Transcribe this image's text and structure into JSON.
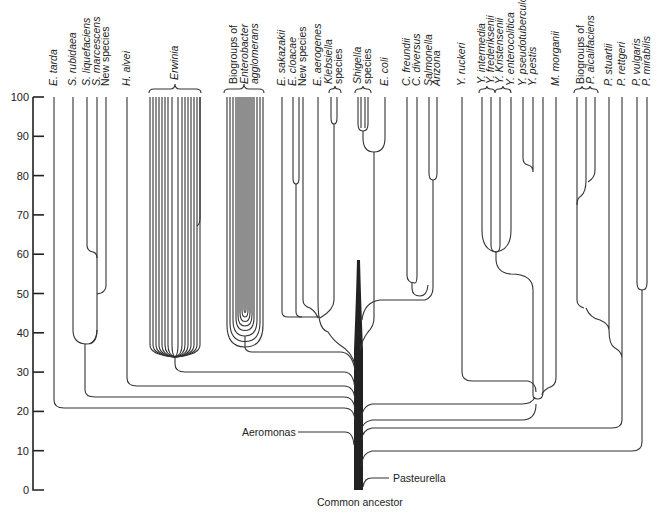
{
  "diagram": {
    "type": "phylogenetic-tree",
    "y_axis": {
      "ticks": [
        0,
        10,
        20,
        30,
        40,
        50,
        60,
        70,
        80,
        90,
        100
      ],
      "range": [
        0,
        100
      ]
    },
    "root_label": "Common ancestor",
    "side_labels": {
      "aeromonas": "Aeromonas",
      "pasteurella": "Pasteurella"
    },
    "leaves": [
      {
        "id": "e_tarda",
        "lines": [
          "E. tarda"
        ],
        "italic": [
          true
        ]
      },
      {
        "id": "s_rubidaea",
        "lines": [
          "S. rubidaea"
        ],
        "italic": [
          true
        ]
      },
      {
        "id": "s_liquefaciens",
        "lines": [
          "S. liquefaciens"
        ],
        "italic": [
          true
        ]
      },
      {
        "id": "s_marcescens",
        "lines": [
          "S. marcescens"
        ],
        "italic": [
          true
        ]
      },
      {
        "id": "new_species_1",
        "lines": [
          "New species"
        ],
        "italic": [
          false
        ]
      },
      {
        "id": "h_alvei",
        "lines": [
          "H. alvei"
        ],
        "italic": [
          true
        ]
      },
      {
        "id": "erwinia",
        "lines": [
          "Erwinia"
        ],
        "italic": [
          true
        ]
      },
      {
        "id": "agglomerans",
        "lines": [
          "Biogroups of",
          "Enterobacter",
          "agglomerans"
        ],
        "italic": [
          false,
          true,
          true
        ]
      },
      {
        "id": "e_sakazakii",
        "lines": [
          "E. sakazakii"
        ],
        "italic": [
          true
        ]
      },
      {
        "id": "e_cloacae",
        "lines": [
          "E. cloacae"
        ],
        "italic": [
          true
        ]
      },
      {
        "id": "new_species_2",
        "lines": [
          "New species"
        ],
        "italic": [
          false
        ]
      },
      {
        "id": "e_aerogenes",
        "lines": [
          "E. aerogenes"
        ],
        "italic": [
          true
        ]
      },
      {
        "id": "klebsiella",
        "lines": [
          "Klebsiella",
          "species"
        ],
        "italic": [
          true,
          false
        ]
      },
      {
        "id": "shigella",
        "lines": [
          "Shigella",
          "species"
        ],
        "italic": [
          true,
          false
        ]
      },
      {
        "id": "e_coli",
        "lines": [
          "E. coli"
        ],
        "italic": [
          true
        ]
      },
      {
        "id": "c_freundii",
        "lines": [
          "C. freundii"
        ],
        "italic": [
          true
        ]
      },
      {
        "id": "c_diversus",
        "lines": [
          "C. diversus"
        ],
        "italic": [
          true
        ]
      },
      {
        "id": "salmonella",
        "lines": [
          "Salmonella"
        ],
        "italic": [
          true
        ]
      },
      {
        "id": "arizona",
        "lines": [
          "Arizona"
        ],
        "italic": [
          true
        ]
      },
      {
        "id": "y_ruckeri",
        "lines": [
          "Y. ruckeri"
        ],
        "italic": [
          true
        ]
      },
      {
        "id": "y_intermedia",
        "lines": [
          "Y. intermedia"
        ],
        "italic": [
          true
        ]
      },
      {
        "id": "y_frederiksenii",
        "lines": [
          "Y. frederiksenii"
        ],
        "italic": [
          true
        ]
      },
      {
        "id": "y_kristensenii",
        "lines": [
          "Y. Kristensenii"
        ],
        "italic": [
          true
        ]
      },
      {
        "id": "y_enterocolitica",
        "lines": [
          "Y. enterocolitica"
        ],
        "italic": [
          true
        ]
      },
      {
        "id": "y_pseudotuberculosis",
        "lines": [
          "Y. pseudotuberculosis"
        ],
        "italic": [
          true
        ]
      },
      {
        "id": "y_pestis",
        "lines": [
          "Y. pestis"
        ],
        "italic": [
          true
        ]
      },
      {
        "id": "m_morganii",
        "lines": [
          "M. morganii"
        ],
        "italic": [
          true
        ]
      },
      {
        "id": "p_alcalifaciens",
        "lines": [
          "Biogroups of",
          "P. alcalifaciens"
        ],
        "italic": [
          false,
          true
        ]
      },
      {
        "id": "p_stuartii",
        "lines": [
          "P. stuartii"
        ],
        "italic": [
          true
        ]
      },
      {
        "id": "p_rettgeri",
        "lines": [
          "P. rettgeri"
        ],
        "italic": [
          true
        ]
      },
      {
        "id": "p_vulgaris",
        "lines": [
          "P. vulgaris"
        ],
        "italic": [
          true
        ]
      },
      {
        "id": "p_mirabilis",
        "lines": [
          "P. mirabilis"
        ],
        "italic": [
          true
        ]
      }
    ],
    "branch_points": [
      {
        "clade": "E. tarda",
        "joins_trunk_at": 21
      },
      {
        "clade": "Serratia group",
        "joins_trunk_at": 24,
        "internal_node": 38
      },
      {
        "clade": "H. alvei",
        "joins_trunk_at": 27
      },
      {
        "clade": "Erwinia",
        "joins_trunk_at": 30,
        "internal_node": 35
      },
      {
        "clade": "Enterobacter agglomerans",
        "joins_trunk_at": 36,
        "internal_node": 37
      },
      {
        "clade": "Enterobacter/Klebsiella/E.coli/Citrobacter/Salmonella",
        "joins_trunk_at": 39
      },
      {
        "clade": "Yersinia + Y. ruckeri",
        "joins_trunk_at": 24
      },
      {
        "clade": "M. morganii",
        "joins_trunk_at": 18
      },
      {
        "clade": "Providencia/Proteus",
        "joins_trunk_at": 17
      },
      {
        "clade": "Proteus",
        "joins_trunk_at": 10
      },
      {
        "clade": "Aeromonas",
        "joins_trunk_at": 13
      },
      {
        "clade": "Pasteurella",
        "joins_trunk_at": 3
      }
    ]
  }
}
